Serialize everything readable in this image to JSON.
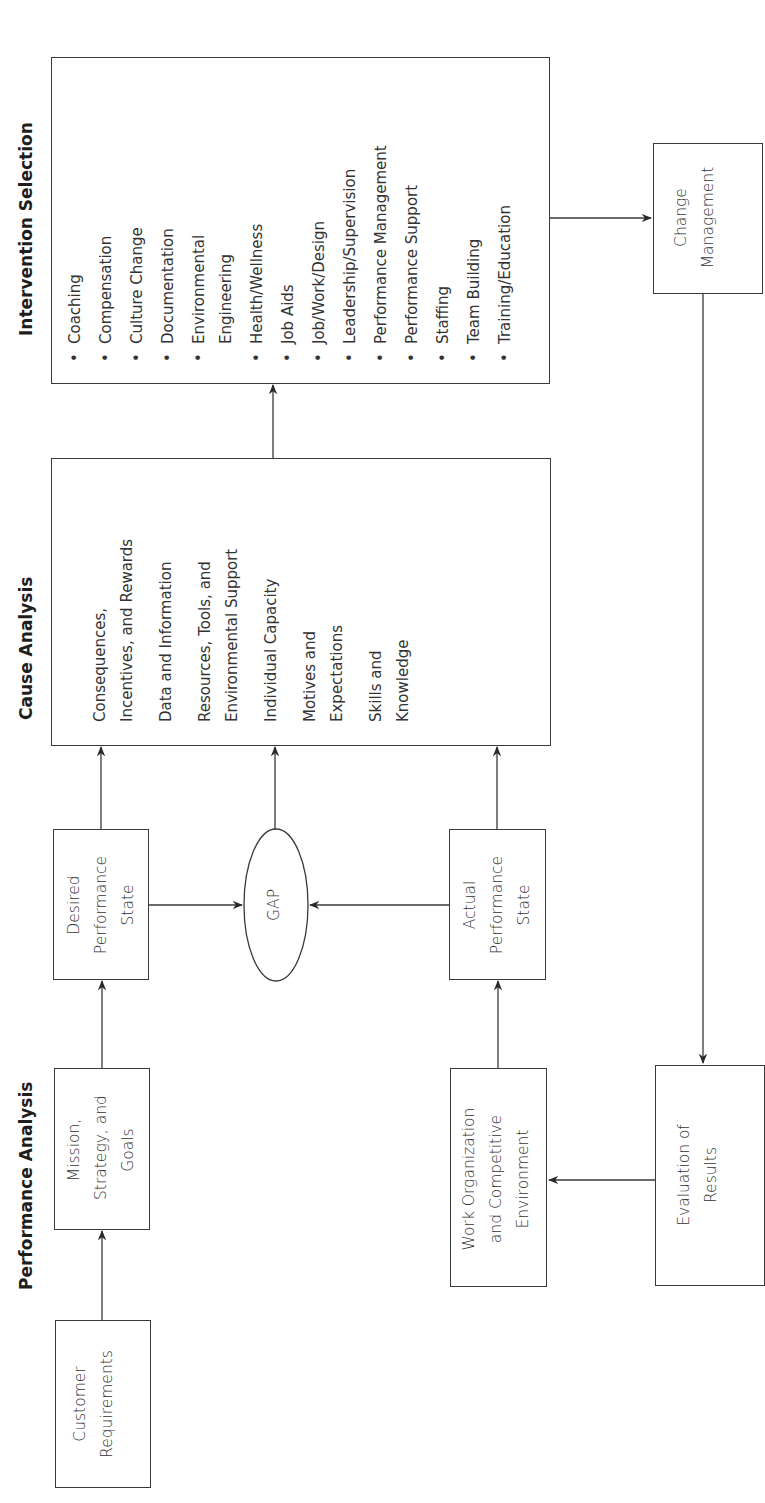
{
  "headings": {
    "performance_analysis": "Performance Analysis",
    "cause_analysis": "Cause Analysis",
    "intervention_selection": "Intervention Selection"
  },
  "nodes": {
    "customer_requirements": [
      "Customer",
      "Requirements"
    ],
    "mission": [
      "Mission,",
      "Strategy, and",
      "Goals"
    ],
    "desired_state": [
      "Desired",
      "Performance",
      "State"
    ],
    "gap": "GAP",
    "actual_state": [
      "Actual",
      "Performance",
      "State"
    ],
    "work_org": [
      "Work Organization",
      "and Competitive",
      "Environment"
    ],
    "change_management": [
      "Change",
      "Management"
    ],
    "evaluation": [
      "Evaluation of",
      "Results"
    ]
  },
  "cause_analysis": {
    "factors": [
      [
        "Consequences,",
        "Incentives, and Rewards"
      ],
      [
        "Data and Information"
      ],
      [
        "Resources, Tools, and",
        "Environmental Support"
      ],
      [
        "Individual Capacity"
      ],
      [
        "Motives and",
        "Expectations"
      ],
      [
        "Skills and",
        "Knowledge"
      ]
    ]
  },
  "intervention_selection": {
    "bullet": "•",
    "items": [
      [
        "Coaching"
      ],
      [
        "Compensation"
      ],
      [
        "Culture Change"
      ],
      [
        "Documentation"
      ],
      [
        "Environmental",
        "Engineering"
      ],
      [
        "Health/Wellness"
      ],
      [
        "Job Aids"
      ],
      [
        "Job/Work/Design"
      ],
      [
        "Leadership/Supervision"
      ],
      [
        "Performance Management"
      ],
      [
        "Performance Support"
      ],
      [
        "Staffing"
      ],
      [
        "Team Building"
      ],
      [
        "Training/Education"
      ]
    ]
  },
  "colors": {
    "line": "#3a3a3a",
    "text": "#333333",
    "background": "#ffffff"
  }
}
